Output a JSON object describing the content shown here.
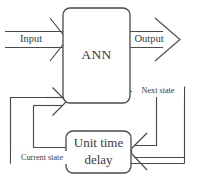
{
  "diagram": {
    "type": "block-diagram",
    "stroke_color": "#4a4a4a",
    "background_color": "#ffffff",
    "blocks": [
      {
        "id": "ann",
        "label": "ANN",
        "shape": "rounded-rectangle"
      },
      {
        "id": "delay",
        "label_line1": "Unit time",
        "label_line2": "delay",
        "shape": "rounded-rectangle"
      }
    ],
    "signals": {
      "input": "Input",
      "output": "Output",
      "next_state": "Next state",
      "current_state": "Current state"
    }
  }
}
